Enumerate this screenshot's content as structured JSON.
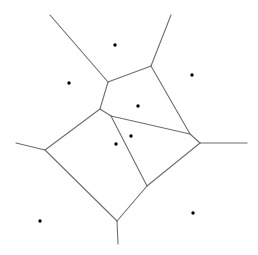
{
  "diagram": {
    "type": "voronoi",
    "width": 258,
    "height": 255,
    "colors": {
      "edge": "#6e6e6e",
      "site": "#000000",
      "background": "#ffffff"
    },
    "sites": [
      {
        "x": 115,
        "y": 45
      },
      {
        "x": 69,
        "y": 83
      },
      {
        "x": 192,
        "y": 75
      },
      {
        "x": 138,
        "y": 106
      },
      {
        "x": 131,
        "y": 136
      },
      {
        "x": 116,
        "y": 144
      },
      {
        "x": 40,
        "y": 221
      },
      {
        "x": 193,
        "y": 213
      }
    ],
    "edges": [
      {
        "x1": 50,
        "y1": 15,
        "x2": 108,
        "y2": 82
      },
      {
        "x1": 171,
        "y1": 15,
        "x2": 151,
        "y2": 66
      },
      {
        "x1": 108,
        "y1": 82,
        "x2": 151,
        "y2": 66
      },
      {
        "x1": 108,
        "y1": 82,
        "x2": 100,
        "y2": 109
      },
      {
        "x1": 151,
        "y1": 66,
        "x2": 190,
        "y2": 134
      },
      {
        "x1": 100,
        "y1": 109,
        "x2": 111,
        "y2": 116
      },
      {
        "x1": 111,
        "y1": 116,
        "x2": 190,
        "y2": 134
      },
      {
        "x1": 190,
        "y1": 134,
        "x2": 200,
        "y2": 143
      },
      {
        "x1": 200,
        "y1": 143,
        "x2": 247,
        "y2": 143
      },
      {
        "x1": 100,
        "y1": 109,
        "x2": 45,
        "y2": 150
      },
      {
        "x1": 16,
        "y1": 143,
        "x2": 45,
        "y2": 150
      },
      {
        "x1": 45,
        "y1": 150,
        "x2": 117,
        "y2": 221
      },
      {
        "x1": 117,
        "y1": 221,
        "x2": 118,
        "y2": 244
      },
      {
        "x1": 117,
        "y1": 221,
        "x2": 147,
        "y2": 186
      },
      {
        "x1": 147,
        "y1": 186,
        "x2": 200,
        "y2": 143
      },
      {
        "x1": 111,
        "y1": 116,
        "x2": 147,
        "y2": 186
      }
    ]
  }
}
